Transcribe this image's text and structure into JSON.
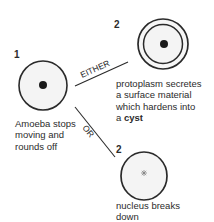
{
  "stage1": {
    "number": "1",
    "caption_lines": [
      "Amoeba stops",
      "moving and",
      "rounds off"
    ]
  },
  "branch_either": {
    "label": "EITHER"
  },
  "branch_or": {
    "label": "OR"
  },
  "stage2_cyst": {
    "number": "2",
    "caption_lines": [
      "protoplasm secretes",
      "a surface material",
      "which hardens into"
    ],
    "caption_last_prefix": "a ",
    "caption_last_bold": "cyst"
  },
  "stage2_breakdown": {
    "number": "2",
    "caption_lines": [
      "nucleus breaks",
      "down"
    ]
  },
  "colors": {
    "outline": "#2a2a2a",
    "cell_fill": "#f4f4f4",
    "background": "#ffffff"
  }
}
